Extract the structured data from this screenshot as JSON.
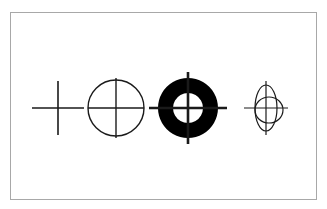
{
  "figure": {
    "title": "Crosshair and target symbol variants",
    "background_color": "#ffffff",
    "frame": {
      "border_color": "#a8a8a8",
      "border_width_px": 1,
      "x": 10,
      "y": 12,
      "width": 307,
      "height": 188
    },
    "stroke_color": "#1a1a1a",
    "fill_color": "#000000",
    "symbol_count": "4",
    "symbols": [
      {
        "index": "1",
        "name": "plain-crosshair",
        "label": "Plain crosshair",
        "description": "Simple cross of one vertical and one horizontal line with no surrounding ring",
        "center_x": 58,
        "center_y": 108,
        "horizontal_half_length": 26,
        "vertical_half_length": 27,
        "line_width": 1.6,
        "has_circle": "no",
        "filled": "no"
      },
      {
        "index": "2",
        "name": "circle-crosshair",
        "label": "Circle with inscribed crosshair",
        "description": "Outline circle with crosshair lines spanning exactly the circle diameter",
        "center_x": 116,
        "center_y": 108,
        "radius": 28,
        "horizontal_half_length": 28,
        "vertical_half_length": 30,
        "line_width": 1.4,
        "has_circle": "yes",
        "filled": "no"
      },
      {
        "index": "3",
        "name": "filled-annulus-crosshair",
        "label": "Filled annulus target with extended crosshair",
        "description": "Solid black ring (donut) with a white inner disc and crosshair lines extending past the outer edge",
        "center_x": 188,
        "center_y": 108,
        "outer_radius": 30,
        "inner_radius": 15,
        "horizontal_half_length": 39,
        "vertical_half_length": 36,
        "line_width": 2.6,
        "has_circle": "yes",
        "filled": "yes"
      },
      {
        "index": "4",
        "name": "double-ellipse-crosshair",
        "label": "Overlapping ellipses with crosshair",
        "description": "Tall narrow vertical ellipse overlapped by a smaller rounder ellipse, with a crosshair",
        "center_x": 268,
        "center_y": 108,
        "outer_ellipse_rx": 11,
        "outer_ellipse_ry": 23,
        "inner_ellipse_rx": 14,
        "inner_ellipse_ry": 13,
        "horizontal_half_length": 22,
        "vertical_half_length": 27,
        "line_width": 1.2,
        "has_circle": "yes",
        "filled": "no"
      }
    ]
  }
}
